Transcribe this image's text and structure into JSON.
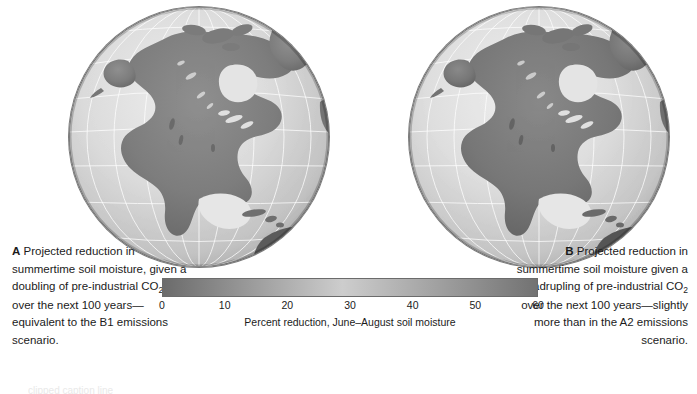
{
  "figure": {
    "panels": [
      {
        "letter": "A",
        "caption_lead": "Projected reduction in summertime soil moisture, given a doubling of pre-industrial CO",
        "caption_sub": "2",
        "caption_tail": " over the next 100 years—equivalent to the B1 emissions scenario."
      },
      {
        "letter": "B",
        "caption_lead": "Projected reduction in summertime soil moisture given a quadrupling of pre-industrial CO",
        "caption_sub": "2",
        "caption_tail": " over the next 100 years—slightly more than in the A2 emissions scenario."
      }
    ]
  },
  "colorbar": {
    "caption": "Percent reduction, June–August soil moisture",
    "ticks": [
      "0",
      "10",
      "20",
      "30",
      "40",
      "50",
      "60"
    ],
    "min": 0,
    "max": 60,
    "start_color": "#6b6b6b",
    "mid_color": "#cdcdcd",
    "end_color": "#727272"
  },
  "bottom_clip": {
    "text": "clipped caption line"
  },
  "chart_data": {
    "type": "heatmap",
    "title": "",
    "subtitle": "",
    "xlabel": "",
    "ylabel": "",
    "legend_position": "bottom-center",
    "grid": true,
    "colorbar_label": "Percent reduction, June–August soil moisture",
    "colorbar_ticks": [
      0,
      10,
      20,
      30,
      40,
      50,
      60
    ],
    "colorbar_range": [
      0,
      60
    ],
    "colormap": [
      "#6b6b6b",
      "#cdcdcd",
      "#727272"
    ],
    "projection": "orthographic globe centered on North America",
    "panels": [
      {
        "label": "A",
        "scenario": "B1 emissions scenario",
        "forcing": "doubling of pre-industrial CO2",
        "horizon_years": 100,
        "variable": "Percent reduction, June-August soil moisture",
        "units": "percent",
        "value_range": [
          0,
          60
        ]
      },
      {
        "label": "B",
        "scenario": "A2 emissions scenario",
        "forcing": "quadrupling of pre-industrial CO2",
        "horizon_years": 100,
        "variable": "Percent reduction, June-August soil moisture",
        "units": "percent",
        "value_range": [
          0,
          60
        ]
      }
    ]
  }
}
